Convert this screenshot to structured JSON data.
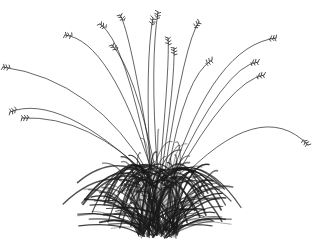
{
  "image": {
    "subject": "ornamental grass clump",
    "style": "pen-and-ink illustration",
    "background": "#ffffff",
    "ink": "#1a1a1a",
    "width": 316,
    "height": 244
  },
  "flowering_stems": [
    {
      "base": [
        150,
        175
      ],
      "ctrl": [
        95,
        80
      ],
      "tip": [
        3,
        67
      ],
      "head": "left"
    },
    {
      "base": [
        150,
        178
      ],
      "ctrl": [
        60,
        92
      ],
      "tip": [
        10,
        112
      ],
      "head": "left"
    },
    {
      "base": [
        152,
        180
      ],
      "ctrl": [
        90,
        115
      ],
      "tip": [
        22,
        118
      ],
      "head": "left"
    },
    {
      "base": [
        152,
        172
      ],
      "ctrl": [
        110,
        40
      ],
      "tip": [
        65,
        35
      ],
      "head": "left"
    },
    {
      "base": [
        150,
        168
      ],
      "ctrl": [
        125,
        40
      ],
      "tip": [
        100,
        24
      ],
      "head": "left"
    },
    {
      "base": [
        152,
        165
      ],
      "ctrl": [
        130,
        30
      ],
      "tip": [
        120,
        15
      ],
      "head": "up"
    },
    {
      "base": [
        155,
        168
      ],
      "ctrl": [
        135,
        70
      ],
      "tip": [
        112,
        45
      ],
      "head": "left"
    },
    {
      "base": [
        150,
        170
      ],
      "ctrl": [
        145,
        60
      ],
      "tip": [
        153,
        18
      ],
      "head": "up"
    },
    {
      "base": [
        157,
        165
      ],
      "ctrl": [
        150,
        60
      ],
      "tip": [
        158,
        12
      ],
      "head": "up"
    },
    {
      "base": [
        160,
        170
      ],
      "ctrl": [
        170,
        60
      ],
      "tip": [
        168,
        38
      ],
      "head": "up"
    },
    {
      "base": [
        162,
        170
      ],
      "ctrl": [
        175,
        80
      ],
      "tip": [
        174,
        48
      ],
      "head": "up"
    },
    {
      "base": [
        165,
        170
      ],
      "ctrl": [
        185,
        40
      ],
      "tip": [
        199,
        22
      ],
      "head": "right"
    },
    {
      "base": [
        168,
        172
      ],
      "ctrl": [
        185,
        75
      ],
      "tip": [
        212,
        60
      ],
      "head": "right"
    },
    {
      "base": [
        172,
        175
      ],
      "ctrl": [
        215,
        45
      ],
      "tip": [
        276,
        38
      ],
      "head": "right"
    },
    {
      "base": [
        172,
        178
      ],
      "ctrl": [
        225,
        65
      ],
      "tip": [
        258,
        62
      ],
      "head": "right"
    },
    {
      "base": [
        174,
        180
      ],
      "ctrl": [
        230,
        80
      ],
      "tip": [
        264,
        75
      ],
      "head": "right"
    },
    {
      "base": [
        178,
        182
      ],
      "ctrl": [
        260,
        95
      ],
      "tip": [
        308,
        145
      ],
      "head": "right"
    }
  ],
  "clump": {
    "center": [
      158,
      190
    ],
    "radius_x": 70,
    "radius_y": 48,
    "dark_core": [
      155,
      180
    ],
    "ground_y": 238,
    "blade_count": 140
  },
  "icons": {
    "seed_head": "grass-seed-head"
  }
}
